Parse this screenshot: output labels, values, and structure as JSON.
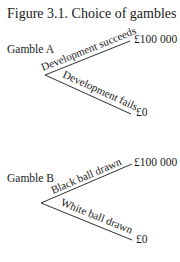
{
  "title": "Figure 3.1. Choice of gambles",
  "gambles": [
    {
      "label": "Gamble A",
      "upper_branch": "Development succeeds",
      "lower_branch": "Development fails",
      "upper_payoff": "£100 000",
      "lower_payoff": "£0"
    },
    {
      "label": "Gamble B",
      "upper_branch": "Black ball drawn",
      "lower_branch": "White ball drawn",
      "upper_payoff": "£100 000",
      "lower_payoff": "£0"
    }
  ]
}
